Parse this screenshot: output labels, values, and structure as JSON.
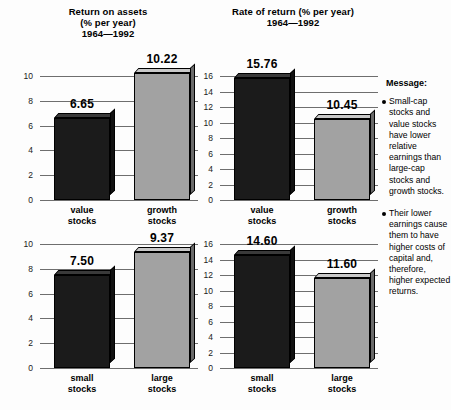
{
  "charts": [
    {
      "id": "return-on-assets",
      "title_lines": [
        "Return on assets",
        "(% per year)",
        "1964—1992"
      ],
      "ylim": [
        0,
        10.8
      ],
      "ticks": [
        0,
        2,
        4,
        6,
        8,
        10
      ],
      "categories": [
        "value\nstocks",
        "growth\nstocks"
      ],
      "cat_line1": [
        "value",
        "growth"
      ],
      "cat_line2": [
        "stocks",
        "stocks"
      ],
      "values": [
        6.65,
        10.22
      ],
      "value_labels": [
        "6.65",
        "10.22"
      ],
      "styles": [
        "dark",
        "light"
      ]
    },
    {
      "id": "rate-of-return",
      "title_lines": [
        "Rate of return (% per year)",
        "1964—1992"
      ],
      "ylim": [
        0,
        17.0
      ],
      "ticks": [
        0,
        2,
        4,
        6,
        8,
        10,
        12,
        14,
        16
      ],
      "categories": [
        "value\nstocks",
        "growth\nstocks"
      ],
      "cat_line1": [
        "value",
        "growth"
      ],
      "cat_line2": [
        "stocks",
        "stocks"
      ],
      "values": [
        15.76,
        10.45
      ],
      "value_labels": [
        "15.76",
        "10.45"
      ],
      "styles": [
        "dark",
        "light"
      ]
    },
    {
      "id": "return-on-assets-size",
      "title_lines": [],
      "ylim": [
        0,
        10.8
      ],
      "ticks": [
        0,
        2,
        4,
        6,
        8,
        10
      ],
      "categories": [
        "small\nstocks",
        "large\nstocks"
      ],
      "cat_line1": [
        "small",
        "large"
      ],
      "cat_line2": [
        "stocks",
        "stocks"
      ],
      "values": [
        7.5,
        9.37
      ],
      "value_labels": [
        "7.50",
        "9.37"
      ],
      "styles": [
        "dark",
        "light"
      ]
    },
    {
      "id": "rate-of-return-size",
      "title_lines": [],
      "ylim": [
        0,
        17.0
      ],
      "ticks": [
        0,
        2,
        4,
        6,
        8,
        10,
        12,
        14,
        16
      ],
      "categories": [
        "small\nstocks",
        "large\nstocks"
      ],
      "cat_line1": [
        "small",
        "large"
      ],
      "cat_line2": [
        "stocks",
        "stocks"
      ],
      "values": [
        14.6,
        11.6
      ],
      "value_labels": [
        "14.60",
        "11.60"
      ],
      "styles": [
        "dark",
        "light"
      ]
    }
  ],
  "message": {
    "title": "Message:",
    "bullets": [
      "Small-cap stocks and value stocks have lower relative earnings than large-cap stocks and growth stocks.",
      "Their lower earnings cause them to have higher costs of capital and, therefore, higher expected returns."
    ]
  },
  "chart_data": [
    {
      "type": "bar",
      "title": "Return on assets (% per year) 1964—1992",
      "categories": [
        "value stocks",
        "growth stocks"
      ],
      "values": [
        6.65,
        10.22
      ],
      "xlabel": "",
      "ylabel": "",
      "ylim": [
        0,
        10.8
      ],
      "yticks": [
        0,
        2,
        4,
        6,
        8,
        10
      ],
      "grid": true,
      "legend": "none",
      "bar_colors": [
        "#1b1b1b",
        "#a2a2a2"
      ],
      "data_labels": [
        "6.65",
        "10.22"
      ]
    },
    {
      "type": "bar",
      "title": "Rate of return (% per year) 1964—1992",
      "categories": [
        "value stocks",
        "growth stocks"
      ],
      "values": [
        15.76,
        10.45
      ],
      "xlabel": "",
      "ylabel": "",
      "ylim": [
        0,
        17.0
      ],
      "yticks": [
        0,
        2,
        4,
        6,
        8,
        10,
        12,
        14,
        16
      ],
      "grid": true,
      "legend": "none",
      "bar_colors": [
        "#1b1b1b",
        "#a2a2a2"
      ],
      "data_labels": [
        "15.76",
        "10.45"
      ]
    },
    {
      "type": "bar",
      "title": "Return on assets (% per year) 1964—1992",
      "categories": [
        "small stocks",
        "large stocks"
      ],
      "values": [
        7.5,
        9.37
      ],
      "xlabel": "",
      "ylabel": "",
      "ylim": [
        0,
        10.8
      ],
      "yticks": [
        0,
        2,
        4,
        6,
        8,
        10
      ],
      "grid": true,
      "legend": "none",
      "bar_colors": [
        "#1b1b1b",
        "#a2a2a2"
      ],
      "data_labels": [
        "7.50",
        "9.37"
      ]
    },
    {
      "type": "bar",
      "title": "Rate of return (% per year) 1964—1992",
      "categories": [
        "small stocks",
        "large stocks"
      ],
      "values": [
        14.6,
        11.6
      ],
      "xlabel": "",
      "ylabel": "",
      "ylim": [
        0,
        17.0
      ],
      "yticks": [
        0,
        2,
        4,
        6,
        8,
        10,
        12,
        14,
        16
      ],
      "grid": true,
      "legend": "none",
      "bar_colors": [
        "#1b1b1b",
        "#a2a2a2"
      ],
      "data_labels": [
        "14.60",
        "11.60"
      ]
    }
  ]
}
